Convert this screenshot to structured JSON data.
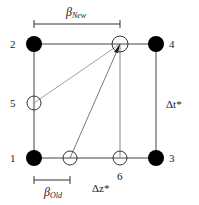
{
  "diagram": {
    "type": "interpolation-grid",
    "colors": {
      "stroke": "#1a1a1a",
      "fill_solid": "#000000",
      "fill_open": "#ffffff"
    },
    "nodes": [
      {
        "id": "1",
        "label": "1",
        "kind": "grid-point",
        "filled": true
      },
      {
        "id": "2",
        "label": "2",
        "kind": "grid-point",
        "filled": true
      },
      {
        "id": "3",
        "label": "3",
        "kind": "grid-point",
        "filled": true
      },
      {
        "id": "4",
        "label": "4",
        "kind": "grid-point",
        "filled": true
      },
      {
        "id": "5",
        "label": "5",
        "kind": "intermediate-point",
        "filled": false
      },
      {
        "id": "6",
        "label": "6",
        "kind": "intermediate-point",
        "filled": false
      },
      {
        "id": "new",
        "label": "",
        "kind": "new-position",
        "filled": false
      },
      {
        "id": "old",
        "label": "",
        "kind": "old-position",
        "filled": false
      }
    ],
    "dimensions": {
      "beta_new": {
        "symbol": "β",
        "subscript": "New"
      },
      "beta_old": {
        "symbol": "β",
        "subscript": "Old"
      },
      "delta_t": "Δt*",
      "delta_z": "Δz*"
    }
  }
}
